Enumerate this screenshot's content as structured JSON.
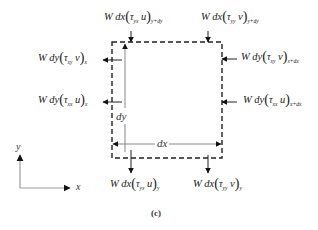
{
  "figure": {
    "caption": "(c)",
    "axes": {
      "x_label": "x",
      "y_label": "y"
    },
    "dimensions": {
      "width_label": "dx",
      "height_label": "dy"
    },
    "flux_labels": {
      "top_left": {
        "coef": "W dx",
        "tau": "τ",
        "tau_sub": "yx",
        "var": "u",
        "eval": "y+dy"
      },
      "top_right": {
        "coef": "W dx",
        "tau": "τ",
        "tau_sub": "yy",
        "var": "v",
        "eval": "y+dy"
      },
      "left_upper": {
        "coef": "W dy",
        "tau": "τ",
        "tau_sub": "xy",
        "var": "v",
        "eval": "x"
      },
      "left_lower": {
        "coef": "W dy",
        "tau": "τ",
        "tau_sub": "xx",
        "var": "u",
        "eval": "x"
      },
      "right_upper": {
        "coef": "W dy",
        "tau": "τ",
        "tau_sub": "xy",
        "var": "v",
        "eval": "x+dx"
      },
      "right_lower": {
        "coef": "W dy",
        "tau": "τ",
        "tau_sub": "xx",
        "var": "u",
        "eval": "x+dx"
      },
      "bottom_left": {
        "coef": "W dx",
        "tau": "τ",
        "tau_sub": "yx",
        "var": "u",
        "eval": "y"
      },
      "bottom_right": {
        "coef": "W dx",
        "tau": "τ",
        "tau_sub": "yy",
        "var": "v",
        "eval": "y"
      }
    },
    "colors": {
      "line": "#222222",
      "axis": "#999999",
      "dim_line": "#888888"
    }
  }
}
